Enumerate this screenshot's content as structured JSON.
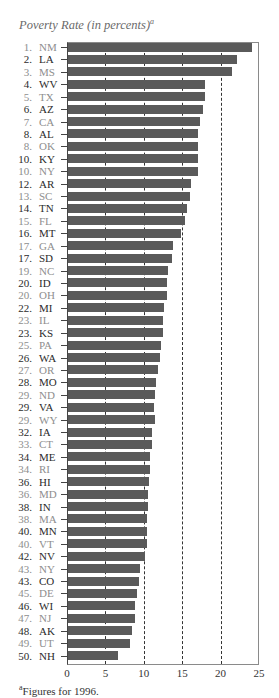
{
  "chart_data": {
    "type": "bar",
    "orientation": "horizontal",
    "title": "Poverty Rate (in percents)",
    "title_footnote_marker": "a",
    "xlabel": "",
    "ylabel": "",
    "xlim": [
      0,
      25
    ],
    "xticks": [
      "0",
      "5",
      "10",
      "15",
      "20",
      "25"
    ],
    "grid": "vertical dashed at 5, 10, 15, 20",
    "footnote_marker": "a",
    "footnote": "Figures for 1996.",
    "bar_color": "#5a5a5a",
    "rows": [
      {
        "rank": "1.",
        "state": "NM",
        "value": 24.1
      },
      {
        "rank": "2.",
        "state": "LA",
        "value": 22.1
      },
      {
        "rank": "3.",
        "state": "MS",
        "value": 21.5
      },
      {
        "rank": "4.",
        "state": "WV",
        "value": 18.0
      },
      {
        "rank": "5.",
        "state": "TX",
        "value": 18.0
      },
      {
        "rank": "6.",
        "state": "AZ",
        "value": 17.7
      },
      {
        "rank": "7.",
        "state": "CA",
        "value": 17.3
      },
      {
        "rank": "8.",
        "state": "AL",
        "value": 17.1
      },
      {
        "rank": "8.",
        "state": "OK",
        "value": 17.1
      },
      {
        "rank": "10.",
        "state": "KY",
        "value": 17.0
      },
      {
        "rank": "10.",
        "state": "NY",
        "value": 17.0
      },
      {
        "rank": "12.",
        "state": "AR",
        "value": 16.1
      },
      {
        "rank": "13.",
        "state": "SC",
        "value": 16.0
      },
      {
        "rank": "14.",
        "state": "TN",
        "value": 15.6
      },
      {
        "rank": "15.",
        "state": "FL",
        "value": 15.4
      },
      {
        "rank": "16.",
        "state": "MT",
        "value": 14.9
      },
      {
        "rank": "17.",
        "state": "GA",
        "value": 13.8
      },
      {
        "rank": "17.",
        "state": "SD",
        "value": 13.7
      },
      {
        "rank": "19.",
        "state": "NC",
        "value": 13.2
      },
      {
        "rank": "20.",
        "state": "ID",
        "value": 13.0
      },
      {
        "rank": "20.",
        "state": "OH",
        "value": 13.0
      },
      {
        "rank": "22.",
        "state": "MI",
        "value": 12.6
      },
      {
        "rank": "23.",
        "state": "IL",
        "value": 12.5
      },
      {
        "rank": "23.",
        "state": "KS",
        "value": 12.5
      },
      {
        "rank": "25.",
        "state": "PA",
        "value": 12.3
      },
      {
        "rank": "26.",
        "state": "WA",
        "value": 12.1
      },
      {
        "rank": "27.",
        "state": "OR",
        "value": 11.8
      },
      {
        "rank": "28.",
        "state": "MO",
        "value": 11.6
      },
      {
        "rank": "29.",
        "state": "ND",
        "value": 11.4
      },
      {
        "rank": "29.",
        "state": "VA",
        "value": 11.3
      },
      {
        "rank": "29.",
        "state": "WY",
        "value": 11.4
      },
      {
        "rank": "32.",
        "state": "IA",
        "value": 11.1
      },
      {
        "rank": "33.",
        "state": "CT",
        "value": 11.1
      },
      {
        "rank": "34.",
        "state": "ME",
        "value": 10.8
      },
      {
        "rank": "34.",
        "state": "RI",
        "value": 10.8
      },
      {
        "rank": "36.",
        "state": "HI",
        "value": 10.7
      },
      {
        "rank": "36.",
        "state": "MD",
        "value": 10.6
      },
      {
        "rank": "38.",
        "state": "IN",
        "value": 10.5
      },
      {
        "rank": "38.",
        "state": "MA",
        "value": 10.4
      },
      {
        "rank": "40.",
        "state": "MN",
        "value": 10.4
      },
      {
        "rank": "40.",
        "state": "VT",
        "value": 10.4
      },
      {
        "rank": "42.",
        "state": "NV",
        "value": 10.2
      },
      {
        "rank": "43.",
        "state": "NY",
        "value": 9.5
      },
      {
        "rank": "43.",
        "state": "CO",
        "value": 9.4
      },
      {
        "rank": "45.",
        "state": "DE",
        "value": 9.1
      },
      {
        "rank": "46.",
        "state": "WI",
        "value": 8.8
      },
      {
        "rank": "47.",
        "state": "NJ",
        "value": 8.8
      },
      {
        "rank": "48.",
        "state": "AK",
        "value": 8.5
      },
      {
        "rank": "49.",
        "state": "UT",
        "value": 8.2
      },
      {
        "rank": "50.",
        "state": "NH",
        "value": 6.7
      }
    ]
  }
}
